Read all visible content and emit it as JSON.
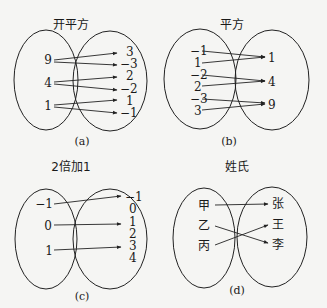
{
  "panels": {
    "a": {
      "title": "开平方",
      "caption": "(a)",
      "domain": [
        "9",
        "4",
        "1"
      ],
      "codomain": [
        "3",
        "−3",
        "2",
        "−2",
        "1",
        "−1"
      ],
      "mappings": [
        [
          "9",
          "3"
        ],
        [
          "9",
          "−3"
        ],
        [
          "4",
          "2"
        ],
        [
          "4",
          "−2"
        ],
        [
          "1",
          "1"
        ],
        [
          "1",
          "−1"
        ]
      ]
    },
    "b": {
      "title": "平方",
      "caption": "(b)",
      "domain": [
        "−1",
        "1",
        "−2",
        "2",
        "−3",
        "3"
      ],
      "codomain": [
        "1",
        "4",
        "9"
      ],
      "mappings": [
        [
          "−1",
          "1"
        ],
        [
          "1",
          "1"
        ],
        [
          "−2",
          "4"
        ],
        [
          "2",
          "4"
        ],
        [
          "−3",
          "9"
        ],
        [
          "3",
          "9"
        ]
      ]
    },
    "c": {
      "title": "2倍加1",
      "caption": "(c)",
      "domain": [
        "−1",
        "0",
        "1"
      ],
      "codomain": [
        "−1",
        "0",
        "1",
        "2",
        "3",
        "4"
      ],
      "mappings": [
        [
          "−1",
          "−1"
        ],
        [
          "0",
          "1"
        ],
        [
          "1",
          "3"
        ]
      ]
    },
    "d": {
      "title": "姓氏",
      "caption": "(d)",
      "domain": [
        "甲",
        "乙",
        "丙"
      ],
      "codomain": [
        "张",
        "王",
        "李"
      ],
      "mappings": [
        [
          "甲",
          "张"
        ],
        [
          "乙",
          "李"
        ],
        [
          "丙",
          "王"
        ]
      ]
    }
  }
}
